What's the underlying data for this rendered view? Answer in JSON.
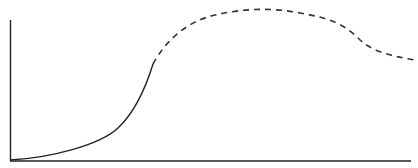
{
  "chart_data": {
    "type": "line",
    "title": "",
    "xlabel": "",
    "ylabel": "",
    "grid": false,
    "legend": null,
    "axes": {
      "x_ticks": [],
      "y_ticks": []
    },
    "series": [
      {
        "name": "observed",
        "style": "solid",
        "color": "#222222",
        "points": [
          [
            0,
            0
          ],
          [
            0.1,
            0.03
          ],
          [
            0.2,
            0.08
          ],
          [
            0.27,
            0.16
          ],
          [
            0.32,
            0.28
          ],
          [
            0.356,
            0.46
          ],
          [
            0.36,
            0.7
          ]
        ]
      },
      {
        "name": "projected",
        "style": "dashed",
        "color": "#333333",
        "points": [
          [
            0.36,
            0.7
          ],
          [
            0.42,
            0.87
          ],
          [
            0.5,
            0.96
          ],
          [
            0.6,
            1.0
          ],
          [
            0.7,
            0.97
          ],
          [
            0.8,
            0.86
          ],
          [
            0.86,
            0.75
          ],
          [
            0.92,
            0.72
          ],
          [
            1.0,
            0.68
          ]
        ]
      }
    ]
  },
  "svg": {
    "axis_color": "#222222",
    "solid_path": "M10,160 C50,158 100,145 118,128 C135,112 145,90 153,64",
    "dashed_path": "M153,64 C165,42 185,22 215,15 C240,9 270,7 300,13 C330,18 345,25 358,38 C370,50 385,55 415,60"
  }
}
